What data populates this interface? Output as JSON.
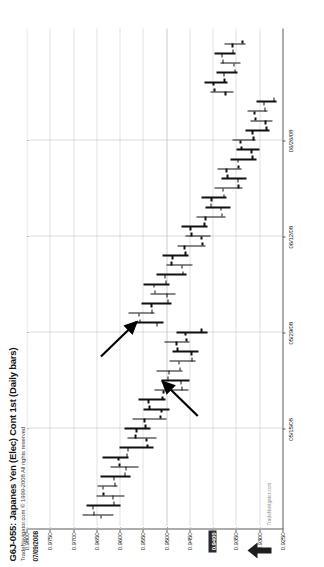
{
  "chart_data": {
    "type": "ohlc",
    "title": "G6J-055: Japanes Yen (Elec) Cont 1st (Daily bars)",
    "subtitle": "TradeNavigator.com © 1999-2008 All rights reserved",
    "quote_readout": "07/09/2008 = 0.9400 (+0.0063)",
    "watermark": "TradeNavigator.com",
    "xlabel": "",
    "ylabel": "",
    "orientation": "rotated-90-ccw",
    "grid": true,
    "legend": "none",
    "ylim": [
      0.925,
      0.98
    ],
    "y_ticks": [
      "0.9800",
      "0.9750",
      "0.9700",
      "0.9650",
      "0.9600",
      "0.9550",
      "0.9500",
      "0.9450",
      "0.9400",
      "0.9350",
      "0.9300",
      "0.9250"
    ],
    "y_tick_values": [
      0.98,
      0.975,
      0.97,
      0.965,
      0.96,
      0.955,
      0.95,
      0.945,
      0.94,
      0.935,
      0.93,
      0.925
    ],
    "y_highlight_label": "0.9400",
    "y_highlight_value": 0.94,
    "x_ticks": [
      "05/15/08",
      "05/29/08",
      "06/12/08",
      "06/26/08"
    ],
    "x_tick_positions": [
      9,
      19,
      29,
      39
    ],
    "axis_arrow_icon": "up-arrow-icon",
    "annotations": [
      {
        "name": "arrow-annotation-upper",
        "label": "",
        "tip_x": 20.2,
        "tip_y": 0.9563,
        "tail_x": 16.6,
        "tail_y": 0.964
      },
      {
        "name": "arrow-annotation-lower",
        "label": "",
        "tip_x": 14.0,
        "tip_y": 0.9508,
        "tail_x": 10.4,
        "tail_y": 0.9432
      }
    ],
    "bars": [
      {
        "i": 0,
        "open": 0.964,
        "high": 0.968,
        "low": 0.9612,
        "close": 0.9655
      },
      {
        "i": 1,
        "open": 0.9657,
        "high": 0.9672,
        "low": 0.9598,
        "close": 0.9612
      },
      {
        "i": 2,
        "open": 0.9614,
        "high": 0.965,
        "low": 0.959,
        "close": 0.9635
      },
      {
        "i": 3,
        "open": 0.9636,
        "high": 0.9648,
        "low": 0.9604,
        "close": 0.961
      },
      {
        "i": 4,
        "open": 0.9612,
        "high": 0.964,
        "low": 0.9576,
        "close": 0.9588
      },
      {
        "i": 5,
        "open": 0.9586,
        "high": 0.962,
        "low": 0.956,
        "close": 0.96
      },
      {
        "i": 6,
        "open": 0.9602,
        "high": 0.9636,
        "low": 0.958,
        "close": 0.9584
      },
      {
        "i": 7,
        "open": 0.9582,
        "high": 0.96,
        "low": 0.9528,
        "close": 0.954
      },
      {
        "i": 8,
        "open": 0.9542,
        "high": 0.9582,
        "low": 0.952,
        "close": 0.9566
      },
      {
        "i": 9,
        "open": 0.9564,
        "high": 0.959,
        "low": 0.9534,
        "close": 0.9544
      },
      {
        "i": 10,
        "open": 0.9546,
        "high": 0.9572,
        "low": 0.95,
        "close": 0.9512
      },
      {
        "i": 11,
        "open": 0.951,
        "high": 0.9548,
        "low": 0.9492,
        "close": 0.9536
      },
      {
        "i": 12,
        "open": 0.9538,
        "high": 0.956,
        "low": 0.9502,
        "close": 0.9508
      },
      {
        "i": 13,
        "open": 0.9506,
        "high": 0.9524,
        "low": 0.9452,
        "close": 0.9466
      },
      {
        "i": 14,
        "open": 0.9468,
        "high": 0.951,
        "low": 0.945,
        "close": 0.9496
      },
      {
        "i": 15,
        "open": 0.9494,
        "high": 0.952,
        "low": 0.9464,
        "close": 0.947
      },
      {
        "i": 16,
        "open": 0.9472,
        "high": 0.9492,
        "low": 0.9436,
        "close": 0.9444
      },
      {
        "i": 17,
        "open": 0.9446,
        "high": 0.9486,
        "low": 0.943,
        "close": 0.9476
      },
      {
        "i": 18,
        "open": 0.9478,
        "high": 0.9504,
        "low": 0.945,
        "close": 0.9456
      },
      {
        "i": 19,
        "open": 0.9458,
        "high": 0.9478,
        "low": 0.9412,
        "close": 0.9424
      },
      {
        "i": 20,
        "open": 0.952,
        "high": 0.9566,
        "low": 0.9506,
        "close": 0.9556
      },
      {
        "i": 21,
        "open": 0.9558,
        "high": 0.958,
        "low": 0.9524,
        "close": 0.953
      },
      {
        "i": 22,
        "open": 0.9532,
        "high": 0.9552,
        "low": 0.9488,
        "close": 0.9496
      },
      {
        "i": 23,
        "open": 0.9498,
        "high": 0.9534,
        "low": 0.948,
        "close": 0.9524
      },
      {
        "i": 24,
        "open": 0.9526,
        "high": 0.9548,
        "low": 0.9492,
        "close": 0.95
      },
      {
        "i": 25,
        "open": 0.9502,
        "high": 0.952,
        "low": 0.9456,
        "close": 0.9464
      },
      {
        "i": 26,
        "open": 0.9466,
        "high": 0.95,
        "low": 0.9444,
        "close": 0.9488
      },
      {
        "i": 27,
        "open": 0.9486,
        "high": 0.9508,
        "low": 0.9452,
        "close": 0.9458
      },
      {
        "i": 28,
        "open": 0.946,
        "high": 0.9476,
        "low": 0.9416,
        "close": 0.9422
      },
      {
        "i": 29,
        "open": 0.9424,
        "high": 0.9458,
        "low": 0.9404,
        "close": 0.9446
      },
      {
        "i": 30,
        "open": 0.9448,
        "high": 0.9466,
        "low": 0.9412,
        "close": 0.9418
      },
      {
        "i": 31,
        "open": 0.9416,
        "high": 0.9434,
        "low": 0.9372,
        "close": 0.938
      },
      {
        "i": 32,
        "open": 0.9382,
        "high": 0.9416,
        "low": 0.9362,
        "close": 0.9404
      },
      {
        "i": 33,
        "open": 0.9402,
        "high": 0.9424,
        "low": 0.937,
        "close": 0.9376
      },
      {
        "i": 34,
        "open": 0.9378,
        "high": 0.9396,
        "low": 0.9336,
        "close": 0.9344
      },
      {
        "i": 35,
        "open": 0.9346,
        "high": 0.938,
        "low": 0.9328,
        "close": 0.9368
      },
      {
        "i": 36,
        "open": 0.937,
        "high": 0.939,
        "low": 0.9338,
        "close": 0.9344
      },
      {
        "i": 37,
        "open": 0.9346,
        "high": 0.9362,
        "low": 0.9306,
        "close": 0.9314
      },
      {
        "i": 38,
        "open": 0.9316,
        "high": 0.9348,
        "low": 0.93,
        "close": 0.9338
      },
      {
        "i": 39,
        "open": 0.934,
        "high": 0.9358,
        "low": 0.9308,
        "close": 0.9312
      },
      {
        "i": 40,
        "open": 0.9314,
        "high": 0.933,
        "low": 0.9278,
        "close": 0.9284
      },
      {
        "i": 41,
        "open": 0.9286,
        "high": 0.9318,
        "low": 0.9272,
        "close": 0.9308
      },
      {
        "i": 42,
        "open": 0.931,
        "high": 0.9326,
        "low": 0.9282,
        "close": 0.9288
      },
      {
        "i": 43,
        "open": 0.929,
        "high": 0.9306,
        "low": 0.9262,
        "close": 0.9268
      },
      {
        "i": 44,
        "open": 0.9372,
        "high": 0.9404,
        "low": 0.9356,
        "close": 0.9396
      },
      {
        "i": 45,
        "open": 0.9398,
        "high": 0.9418,
        "low": 0.9368,
        "close": 0.9374
      },
      {
        "i": 46,
        "open": 0.9376,
        "high": 0.9392,
        "low": 0.9346,
        "close": 0.9352
      },
      {
        "i": 47,
        "open": 0.9354,
        "high": 0.9384,
        "low": 0.934,
        "close": 0.9378
      },
      {
        "i": 48,
        "open": 0.938,
        "high": 0.9396,
        "low": 0.935,
        "close": 0.9356
      },
      {
        "i": 49,
        "open": 0.9358,
        "high": 0.9374,
        "low": 0.933,
        "close": 0.9336
      }
    ]
  }
}
